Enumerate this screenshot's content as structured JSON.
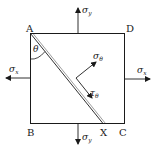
{
  "diagram": {
    "type": "stress-element",
    "colors": {
      "stroke": "#1a1a1a",
      "background": "#ffffff"
    },
    "corners": {
      "A": "A",
      "B": "B",
      "C": "C",
      "D": "D",
      "X": "X"
    },
    "angle_label": "θ",
    "stresses": {
      "sigma_y_top": {
        "symbol": "σ",
        "subscript": "y"
      },
      "sigma_y_bottom": {
        "symbol": "σ",
        "subscript": "y"
      },
      "sigma_x_left": {
        "symbol": "σ",
        "subscript": "x"
      },
      "sigma_x_right": {
        "symbol": "σ",
        "subscript": "x"
      },
      "sigma_theta": {
        "symbol": "σ",
        "subscript": "θ"
      },
      "tau_theta": {
        "symbol": "τ",
        "subscript": "θ"
      }
    }
  }
}
